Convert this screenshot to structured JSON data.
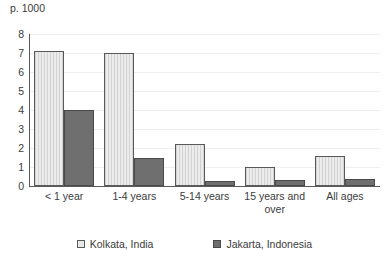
{
  "chart_data": {
    "type": "bar",
    "title": "",
    "ylabel": "p. 1000",
    "xlabel": "",
    "categories": [
      "< 1 year",
      "1-4 years",
      "5-14 years",
      "15 years and over",
      "All ages"
    ],
    "series": [
      {
        "name": "Kolkata, India",
        "color": "#e2e2e2",
        "values": [
          7.1,
          7.0,
          2.2,
          1.0,
          1.6
        ]
      },
      {
        "name": "Jakarta, Indonesia",
        "color": "#6f6f6f",
        "values": [
          4.0,
          1.5,
          0.25,
          0.3,
          0.35
        ]
      }
    ],
    "ylim": [
      0,
      8
    ],
    "yticks": [
      "0",
      "1",
      "2",
      "3",
      "4",
      "5",
      "6",
      "7",
      "8"
    ],
    "grid": true,
    "legend_position": "bottom"
  }
}
